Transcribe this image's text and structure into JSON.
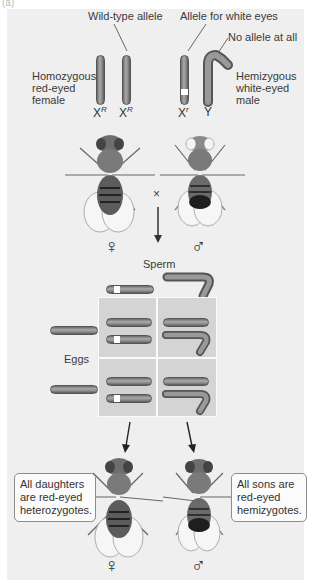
{
  "figure": {
    "panel_label": "(a)",
    "background_color": "#efefef",
    "parents": {
      "female": {
        "description": [
          "Homozygous",
          "red-eyed",
          "female"
        ],
        "chromosomes": [
          "X",
          "X"
        ],
        "chromosome_superscripts": [
          "R",
          "R"
        ],
        "sex_symbol": "♀",
        "eye_color": "red"
      },
      "male": {
        "description": [
          "Hemizygous",
          "white-eyed",
          "male"
        ],
        "chromosomes": [
          "X",
          "Y"
        ],
        "chromosome_superscripts": [
          "r",
          ""
        ],
        "sex_symbol": "♂",
        "eye_color": "white"
      },
      "cross_symbol": "×"
    },
    "annotations": {
      "wild_type": "Wild-type allele",
      "white_eyes": "Allele for white eyes",
      "no_allele": "No allele at all"
    },
    "punnett": {
      "sperm_label": "Sperm",
      "eggs_label": "Eggs",
      "sperm": [
        "Xr",
        "Y"
      ],
      "eggs": [
        "XR",
        "XR"
      ],
      "cells": [
        [
          "XR Xr",
          "XR Y"
        ],
        [
          "XR Xr",
          "XR Y"
        ]
      ]
    },
    "offspring": {
      "daughters": {
        "callout": [
          "All daughters",
          "are red-eyed",
          "heterozygotes."
        ],
        "sex_symbol": "♀"
      },
      "sons": {
        "callout": [
          "All sons are",
          "red-eyed",
          "hemizygotes."
        ],
        "sex_symbol": "♂"
      }
    }
  }
}
